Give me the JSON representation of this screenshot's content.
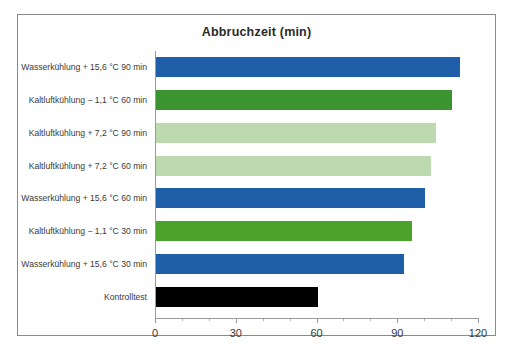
{
  "chart_data": {
    "type": "bar",
    "orientation": "horizontal",
    "title": "Abbruchzeit (min)",
    "xlabel": "",
    "ylabel": "",
    "xlim": [
      0,
      120
    ],
    "grid": false,
    "legend": "none",
    "x_major_ticks": [
      0,
      30,
      60,
      90,
      120
    ],
    "x_minor_tick_interval": 10,
    "tick_labels": [
      "0",
      "30",
      "60",
      "90",
      "120"
    ],
    "categories": [
      "Wasserkühlung + 15,6 °C 90 min",
      "Kaltluftkühlung − 1,1 °C 60 min",
      "Kaltluftkühlung + 7,2 °C 90 min",
      "Kaltluftkühlung + 7,2 °C 60 min",
      "Wasserkühlung + 15,6 °C 60 min",
      "Kaltluftkühlung − 1,1 °C 30 min",
      "Wasserkühlung + 15,6 °C 30 min",
      "Kontrolltest"
    ],
    "values": [
      113,
      110,
      104,
      102,
      100,
      95,
      92,
      60
    ],
    "bar_colors": [
      "#1F5FA9",
      "#3C9431",
      "#BCD9B0",
      "#BCD9B0",
      "#1F5FA9",
      "#4CA32B",
      "#1F5FA9",
      "#000000"
    ],
    "bars": [
      {
        "label": "Wasserkühlung + 15,6 °C 90 min",
        "value": 113,
        "color": "#1F5FA9"
      },
      {
        "label": "Kaltluftkühlung − 1,1 °C 60 min",
        "value": 110,
        "color": "#3C9431"
      },
      {
        "label": "Kaltluftkühlung + 7,2 °C 90 min",
        "value": 104,
        "color": "#BCD9B0"
      },
      {
        "label": "Kaltluftkühlung + 7,2 °C 60 min",
        "value": 102,
        "color": "#BCD9B0"
      },
      {
        "label": "Wasserkühlung + 15,6 °C 60 min",
        "value": 100,
        "color": "#1F5FA9"
      },
      {
        "label": "Kaltluftkühlung − 1,1 °C 30 min",
        "value": 95,
        "color": "#4CA32B"
      },
      {
        "label": "Wasserkühlung + 15,6 °C 30 min",
        "value": 92,
        "color": "#1F5FA9"
      },
      {
        "label": "Kontrolltest",
        "value": 60,
        "color": "#000000"
      }
    ]
  },
  "style": {
    "frame_border_color": "#8a8a8a",
    "axis_color": "#9a9a9a",
    "background": "#ffffff",
    "text_color": "#3a3a3a"
  }
}
